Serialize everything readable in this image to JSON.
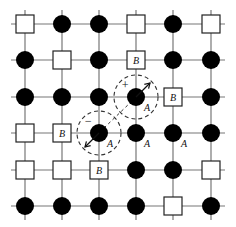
{
  "diagram": {
    "type": "lattice",
    "rows": 6,
    "cols": 6,
    "grid_color": "#777777",
    "atom_color": "#000000",
    "vacancy_fill": "#ffffff",
    "vacancy_stroke": "#222222",
    "col_x": [
      25,
      62,
      99,
      136,
      173,
      211
    ],
    "row_y": [
      24,
      60,
      97,
      133,
      170,
      206
    ],
    "legend": {
      "filled_circle": "A atom",
      "square": "B site / vacancy"
    },
    "cells": [
      [
        "square",
        "circle",
        "circle",
        "square",
        "circle",
        "square"
      ],
      [
        "circle",
        "square",
        "circle",
        "square-B",
        "circle",
        "circle"
      ],
      [
        "circle",
        "circle",
        "circle",
        "circle-A",
        "square-B",
        "circle"
      ],
      [
        "square",
        "square-B",
        "circle-A",
        "circle-A",
        "circle-A",
        "circle"
      ],
      [
        "square",
        "square",
        "square-B",
        "circle",
        "circle",
        "square"
      ],
      [
        "circle",
        "circle",
        "circle",
        "circle",
        "square",
        "circle"
      ]
    ],
    "labels": {
      "A": "A",
      "B": "B",
      "plus": "+",
      "minus": "−"
    },
    "dipoles": [
      {
        "center_row": 2,
        "center_col": 3,
        "sign": "+",
        "arrow_direction": "up-right",
        "radius": 22
      },
      {
        "center_row": 3,
        "center_col": 2,
        "sign": "−",
        "arrow_direction": "down-left",
        "radius": 22
      }
    ]
  }
}
